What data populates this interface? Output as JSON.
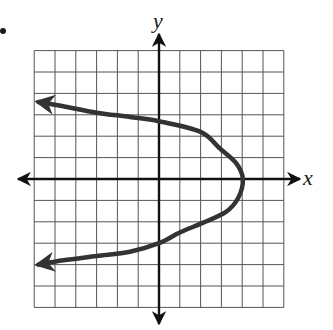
{
  "chart_data": {
    "type": "line",
    "title": "",
    "xlabel": "x",
    "ylabel": "y",
    "grid": true,
    "xlim": [
      -6,
      6
    ],
    "ylim": [
      -6,
      6
    ],
    "grid_step": 1,
    "legend": null,
    "curve": {
      "description": "Horizontal parabola opening left with vertex on the x-axis",
      "vertex": [
        4,
        0
      ],
      "y_intercepts": [
        2.8,
        -3
      ],
      "arrow_ends": [
        [
          -5.8,
          3.6
        ],
        [
          -5.8,
          -4.0
        ]
      ],
      "points": [
        [
          -5.8,
          3.6
        ],
        [
          -4.6,
          3.4
        ],
        [
          -3.0,
          3.1
        ],
        [
          -1.4,
          2.9
        ],
        [
          0,
          2.7
        ],
        [
          2.0,
          2.2
        ],
        [
          2.9,
          1.45
        ],
        [
          3.7,
          0.75
        ],
        [
          4.03,
          0
        ],
        [
          3.8,
          -0.9
        ],
        [
          3.2,
          -1.55
        ],
        [
          2.1,
          -2.05
        ],
        [
          1.0,
          -2.5
        ],
        [
          0,
          -3.0
        ],
        [
          -1.4,
          -3.4
        ],
        [
          -3.0,
          -3.6
        ],
        [
          -4.6,
          -3.8
        ],
        [
          -5.8,
          -4.0
        ]
      ],
      "color": "#333333"
    }
  },
  "labels": {
    "x_axis": "x",
    "y_axis": "y"
  },
  "colors": {
    "grid": "#555555",
    "axis": "#111111",
    "curve": "#333333"
  }
}
